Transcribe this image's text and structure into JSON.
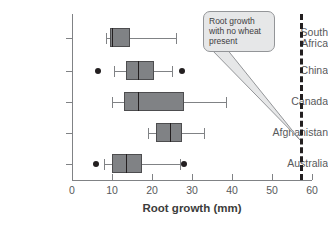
{
  "chart_data": {
    "type": "box",
    "title": "",
    "xlabel": "Root growth (mm)",
    "ylabel": "",
    "xlim": [
      0,
      60
    ],
    "xticks": [
      0,
      10,
      20,
      30,
      40,
      50,
      60
    ],
    "xtick_labels": [
      "0",
      "10",
      "20",
      "30",
      "40",
      "50",
      "60"
    ],
    "grid": false,
    "orientation": "horizontal",
    "categories": [
      "South Africa",
      "China",
      "Canada",
      "Afghanistan",
      "Australia"
    ],
    "boxes": [
      {
        "category": "South Africa",
        "whisker_low": 8.5,
        "q1": 9.5,
        "median": 10.0,
        "q3": 14.5,
        "whisker_high": 26.0,
        "outliers": []
      },
      {
        "category": "China",
        "whisker_low": 10.5,
        "q1": 13.5,
        "median": 16.5,
        "q3": 20.5,
        "whisker_high": 25.0,
        "outliers": [
          6.5,
          27.5
        ]
      },
      {
        "category": "Canada",
        "whisker_low": 10.0,
        "q1": 13.0,
        "median": 16.5,
        "q3": 28.0,
        "whisker_high": 38.5,
        "outliers": []
      },
      {
        "category": "Afghanistan",
        "whisker_low": 19.0,
        "q1": 21.0,
        "median": 24.5,
        "q3": 27.5,
        "whisker_high": 33.0,
        "outliers": []
      },
      {
        "category": "Australia",
        "whisker_low": 8.0,
        "q1": 10.0,
        "median": 13.5,
        "q3": 17.5,
        "whisker_high": 27.0,
        "outliers": [
          6.0,
          28.0
        ]
      }
    ],
    "reference_line": {
      "value": 57,
      "style": "dashed",
      "label": "Root growth with no wheat present"
    },
    "annotation": {
      "lines": [
        "Root growth",
        "with no wheat",
        "present"
      ],
      "points_to": 57
    },
    "colors": {
      "box_fill": "#808285",
      "box_edge": "#4d4d4f",
      "median": "#231f20",
      "whisker": "#808285",
      "outlier": "#231f20",
      "refline": "#231f20",
      "callout_fill": "#e6e7e8",
      "callout_edge": "#939598",
      "axis": "#808285",
      "text": "#58595b"
    }
  }
}
